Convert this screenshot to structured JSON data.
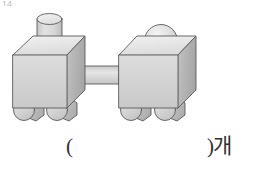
{
  "canvas": {
    "width": 256,
    "height": 175,
    "background": "#ffffff"
  },
  "corner_mark": {
    "text": "14"
  },
  "answer_line": {
    "paren_open": "(",
    "paren_close_unit": ")개"
  },
  "figure": {
    "name": "two-block-train",
    "colors": {
      "outline": "#5a5a5a",
      "front_face": "#d4d4d4",
      "top_face": "#e8e8e8",
      "side_face": "#b3b3b3",
      "wheel_face": "#cfcfcf",
      "wheel_side": "#b8b8b8",
      "cylinder_body": "#d2d2d2",
      "cylinder_top": "#eaeaea",
      "sphere": "#dcdcdc",
      "rod": "#d6d6d6"
    },
    "parts": [
      {
        "name": "left-box",
        "shape": "rectangular-prism"
      },
      {
        "name": "left-top-cylinder",
        "shape": "cylinder"
      },
      {
        "name": "left-wheel-front",
        "shape": "cylinder"
      },
      {
        "name": "left-wheel-rear",
        "shape": "cylinder"
      },
      {
        "name": "connecting-rod",
        "shape": "cylinder"
      },
      {
        "name": "right-box",
        "shape": "rectangular-prism"
      },
      {
        "name": "right-top-sphere",
        "shape": "sphere"
      },
      {
        "name": "right-wheel-front",
        "shape": "cylinder"
      },
      {
        "name": "right-wheel-rear",
        "shape": "cylinder"
      }
    ]
  }
}
